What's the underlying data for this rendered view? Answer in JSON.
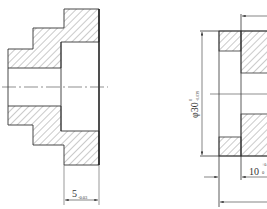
{
  "drawing": {
    "left_view": {
      "dimension": {
        "value": "5",
        "tolerance_lower": "-0.03"
      }
    },
    "right_view": {
      "diameter_dimension": {
        "symbol": "φ",
        "value": "30",
        "tolerance_upper": "0",
        "tolerance_lower": "-0.039"
      },
      "length_dimension": {
        "value": "10",
        "tolerance_upper": "+0.1",
        "tolerance_lower": "0"
      }
    }
  },
  "colors": {
    "line": "#333333",
    "hatch": "#555555",
    "background": "#ffffff"
  }
}
